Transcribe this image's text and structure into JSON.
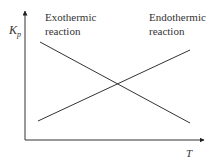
{
  "diagram": {
    "y_axis_label": "K",
    "y_axis_subscript": "p",
    "x_axis_label": "T",
    "lines": [
      {
        "name": "Exothermic reaction",
        "label_line1": "Exothermic",
        "label_line2": "reaction",
        "trend": "decreasing"
      },
      {
        "name": "Endothermic reaction",
        "label_line1": "Endothermic",
        "label_line2": "reaction",
        "trend": "increasing"
      }
    ],
    "colors": {
      "stroke": "#333333",
      "background": "#ffffff"
    }
  }
}
